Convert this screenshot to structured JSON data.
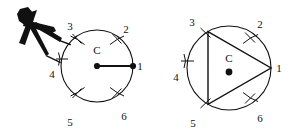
{
  "figure": {
    "kind": "geometry-construction-diagram",
    "background_color": "#ffffff",
    "ink_color": "#111111"
  },
  "left_figure": {
    "name": "circle-with-compass",
    "circle": {
      "center_label": "C",
      "center_x": 97,
      "center_y": 66,
      "radius": 36
    },
    "radius_line": {
      "from_label": "C",
      "to_label": "1",
      "visible": true
    },
    "tick_points": [
      {
        "label": "1",
        "angle_deg": 0,
        "label_x": 140,
        "label_y": 70
      },
      {
        "label": "2",
        "angle_deg": 60,
        "label_x": 126,
        "label_y": 33
      },
      {
        "label": "3",
        "angle_deg": 120,
        "label_x": 70,
        "label_y": 30
      },
      {
        "label": "4",
        "angle_deg": 180,
        "label_x": 52,
        "label_y": 78
      },
      {
        "label": "5",
        "angle_deg": 240,
        "label_x": 70,
        "label_y": 126
      },
      {
        "label": "6",
        "angle_deg": 300,
        "label_x": 124,
        "label_y": 120
      }
    ],
    "compass": {
      "name": "compass-tool",
      "pivot_point_label": "3",
      "pencil_leg_label": "4",
      "filled": true
    }
  },
  "right_figure": {
    "name": "circle-with-inscribed-triangle",
    "circle": {
      "center_label": "C",
      "center_x": 229,
      "center_y": 68,
      "radius": 42
    },
    "triangle": {
      "vertex_labels": [
        "3",
        "1",
        "5"
      ],
      "chords": [
        {
          "from": "3",
          "to": "1"
        },
        {
          "from": "1",
          "to": "5"
        },
        {
          "from": "5",
          "to": "3"
        }
      ]
    },
    "tick_points": [
      {
        "label": "1",
        "angle_deg": 0,
        "label_x": 279,
        "label_y": 72
      },
      {
        "label": "2",
        "angle_deg": 60,
        "label_x": 260,
        "label_y": 28
      },
      {
        "label": "3",
        "angle_deg": 120,
        "label_x": 192,
        "label_y": 26
      },
      {
        "label": "4",
        "angle_deg": 180,
        "label_x": 176,
        "label_y": 81
      },
      {
        "label": "5",
        "angle_deg": 240,
        "label_x": 193,
        "label_y": 127
      },
      {
        "label": "6",
        "angle_deg": 300,
        "label_x": 260,
        "label_y": 122
      }
    ]
  }
}
